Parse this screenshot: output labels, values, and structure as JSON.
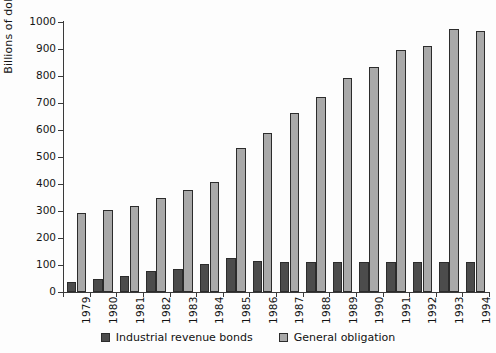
{
  "chart_data": {
    "type": "bar",
    "title": "",
    "subtitle": "",
    "xlabel": "",
    "ylabel": "Billions of dollars",
    "ylim": [
      0,
      1000
    ],
    "yticks": [
      0,
      100,
      200,
      300,
      400,
      500,
      600,
      700,
      800,
      900,
      1000
    ],
    "ytick_labels": [
      "0",
      "100",
      "200",
      "300",
      "400",
      "500",
      "600",
      "700",
      "800",
      "900",
      "1000"
    ],
    "grid": false,
    "legend_position": "bottom",
    "grouping": "grouped",
    "categories": [
      "1979",
      "1980",
      "1981",
      "1982",
      "1983",
      "1984",
      "1985",
      "1986",
      "1987",
      "1988",
      "1989",
      "1990",
      "1991",
      "1992",
      "1993",
      "1994"
    ],
    "series": [
      {
        "name": "Industrial revenue bonds",
        "color": "#4c4c4c",
        "values": [
          37,
          47,
          60,
          76,
          86,
          103,
          125,
          114,
          113,
          112,
          112,
          112,
          111,
          111,
          110,
          110
        ]
      },
      {
        "name": "General obligation",
        "color": "#a9a9a9",
        "values": [
          293,
          303,
          317,
          348,
          379,
          408,
          534,
          590,
          664,
          723,
          792,
          835,
          897,
          912,
          975,
          967
        ]
      }
    ]
  },
  "axis": {
    "y_title": "Billions of dollars"
  },
  "legend": {
    "items": [
      {
        "label": "Industrial revenue bonds",
        "color": "#4c4c4c"
      },
      {
        "label": "General obligation",
        "color": "#a9a9a9"
      }
    ]
  },
  "colors": {
    "series_dark": "#4c4c4c",
    "series_light": "#a9a9a9",
    "axis": "#3a3a3a",
    "text": "#111111",
    "background": "#fdfdfd"
  }
}
